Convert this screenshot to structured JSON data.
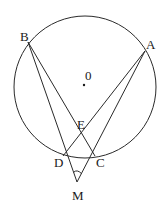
{
  "diagram": {
    "type": "geometry",
    "circle": {
      "center_label": "0",
      "cx": 85,
      "cy": 87,
      "r": 71
    },
    "points": {
      "A": {
        "label": "A",
        "x": 145,
        "y": 51
      },
      "B": {
        "label": "B",
        "x": 28,
        "y": 42
      },
      "C": {
        "label": "C",
        "x": 95,
        "y": 156
      },
      "D": {
        "label": "D",
        "x": 63,
        "y": 156
      },
      "E": {
        "label": "E",
        "x": 81,
        "y": 135
      },
      "M": {
        "label": "M",
        "x": 77,
        "y": 182
      },
      "O": {
        "label": "0",
        "x": 84,
        "y": 85
      }
    },
    "segments": [
      "B-M",
      "B-C",
      "A-M",
      "A-D"
    ],
    "angle_marks": [
      "angle DMC"
    ],
    "colors": {
      "line": "#2a2a2a",
      "background": "#ffffff"
    }
  }
}
